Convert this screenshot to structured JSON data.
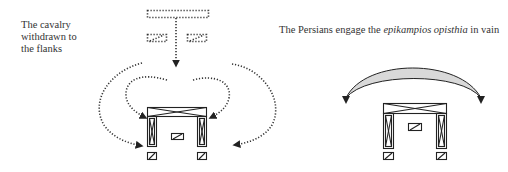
{
  "panels": [
    {
      "id": "left",
      "caption_lines": [
        "The cavalry",
        "withdrawn to",
        "the flanks"
      ],
      "elements": [
        "cavalry-dotted-block",
        "cavalry-dotted-squadron-left",
        "cavalry-dotted-squadron-right",
        "withdrawal-arrow",
        "flank-arrows-left",
        "flank-arrows-right",
        "infantry-formation"
      ]
    },
    {
      "id": "right",
      "caption": {
        "prefix": "The Persians engage the ",
        "italic": "epikampios opisthia",
        "suffix": " in vain"
      },
      "elements": [
        "persian-crescent-arrow",
        "infantry-formation"
      ]
    }
  ],
  "colors": {
    "ink": "#333333",
    "crescent_fill": "#d9d9d9",
    "background": "#ffffff"
  }
}
